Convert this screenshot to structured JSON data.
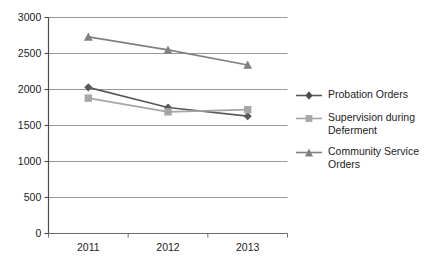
{
  "chart_data": {
    "type": "line",
    "title": "",
    "xlabel": "",
    "ylabel": "",
    "categories": [
      "2011",
      "2012",
      "2013"
    ],
    "ylim": [
      0,
      3000
    ],
    "ytick_labels": [
      "0",
      "500",
      "1000",
      "1500",
      "2000",
      "2500",
      "3000"
    ],
    "yticks": [
      0,
      500,
      1000,
      1500,
      2000,
      2500,
      3000
    ],
    "grid": "horizontal",
    "legend_position": "right",
    "series": [
      {
        "name": "Probation Orders",
        "values": [
          2030,
          1750,
          1630
        ],
        "color": "#595959",
        "marker": "diamond"
      },
      {
        "name": "Supervision during\nDeferment",
        "values": [
          1880,
          1690,
          1720
        ],
        "color": "#a6a6a6",
        "marker": "square"
      },
      {
        "name": "Community Service\nOrders",
        "values": [
          2730,
          2550,
          2340
        ],
        "color": "#808080",
        "marker": "triangle"
      }
    ]
  },
  "axes": {
    "y_labels": [
      "3000",
      "2500",
      "2000",
      "1500",
      "1000",
      "500",
      "0"
    ],
    "x_labels": [
      "2011",
      "2012",
      "2013"
    ]
  },
  "legend": {
    "items": [
      {
        "label": "Probation Orders"
      },
      {
        "label": "Supervision during\nDeferment"
      },
      {
        "label": "Community Service\nOrders"
      }
    ]
  }
}
